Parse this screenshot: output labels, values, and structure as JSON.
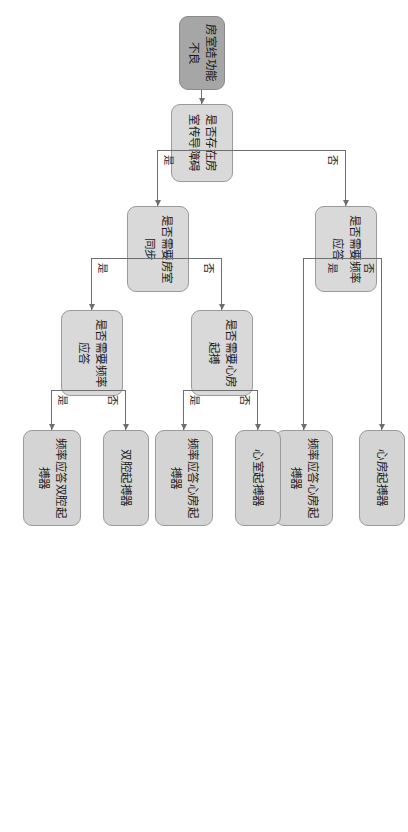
{
  "diagram": {
    "orientation": "left-to-right, rendered rotated 90 degrees clockwise",
    "colors": {
      "root_fill": "#a6a6a6",
      "node_fill": "#d9d9d9",
      "leaf_fill": "#d4d4d4",
      "border": "#9a9a9a",
      "edge": "#6e6e6e",
      "text": "#1a1a1a",
      "background": "#ffffff"
    },
    "nodes": {
      "root": "房室结功能不良",
      "q_conduction": "是否存在房室传导障碍",
      "q_rate_response_top": "是否需要频率应答",
      "leaf_atrial_pacer": "心房起搏器",
      "leaf_rate_atrial_pacer": "频率应答心房起搏器",
      "q_av_sync": "是否需要房室同步",
      "q_atrial_pacing": "是否需要心房起搏",
      "leaf_ventricular_pacer": "心室起搏器",
      "leaf_rate_atrial_pacer_2": "频率应答心房起搏器",
      "q_rate_response_bottom": "是否需要频率应答",
      "leaf_dual_chamber_pacer": "双腔起搏器",
      "leaf_rate_dual_chamber_pacer": "频率应答双腔起搏器"
    },
    "edge_labels": {
      "conduction_no": "否",
      "conduction_yes": "是",
      "rate_top_yes": "是",
      "rate_top_no": "否",
      "sync_no": "否",
      "sync_yes": "是",
      "atrial_yes": "是",
      "atrial_no": "否",
      "rate_bottom_yes": "是",
      "rate_bottom_no": "否"
    }
  }
}
